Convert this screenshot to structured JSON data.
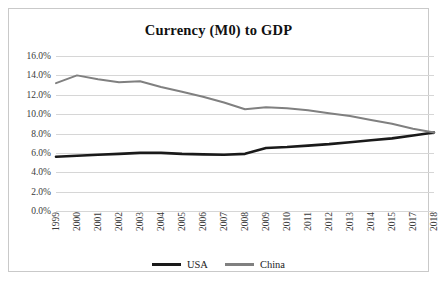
{
  "chart_data": {
    "type": "line",
    "title": "Currency (M0) to GDP",
    "xlabel": "",
    "ylabel": "",
    "grid": true,
    "legend_position": "bottom",
    "ylim": [
      0,
      16
    ],
    "y_tick_labels": [
      "16.0%",
      "14.0%",
      "12.0%",
      "10.0%",
      "8.0%",
      "6.0%",
      "4.0%",
      "2.0%",
      "0.0%"
    ],
    "y_tick_values": [
      16,
      14,
      12,
      10,
      8,
      6,
      4,
      2,
      0
    ],
    "categories": [
      "1999",
      "2000",
      "2001",
      "2002",
      "2003",
      "2004",
      "2005",
      "2006",
      "2007",
      "2008",
      "2009",
      "2010",
      "2011",
      "2012",
      "2013",
      "2014",
      "2015",
      "2017",
      "2018"
    ],
    "series": [
      {
        "name": "USA",
        "color": "#1a1a1a",
        "line_width": 2.6,
        "values": [
          5.6,
          5.7,
          5.8,
          5.9,
          6.0,
          6.0,
          5.9,
          5.85,
          5.8,
          5.9,
          6.5,
          6.6,
          6.75,
          6.9,
          7.1,
          7.3,
          7.5,
          7.8,
          8.1
        ]
      },
      {
        "name": "China",
        "color": "#808080",
        "line_width": 2.0,
        "values": [
          13.2,
          14.0,
          13.6,
          13.3,
          13.4,
          12.8,
          12.3,
          11.8,
          11.2,
          10.5,
          10.7,
          10.6,
          10.4,
          10.1,
          9.8,
          9.4,
          9.0,
          8.5,
          8.1
        ]
      }
    ]
  },
  "legend": {
    "entries": [
      {
        "label": "USA",
        "color": "#1a1a1a",
        "thickness": "3px"
      },
      {
        "label": "China",
        "color": "#808080",
        "thickness": "3px"
      }
    ]
  }
}
